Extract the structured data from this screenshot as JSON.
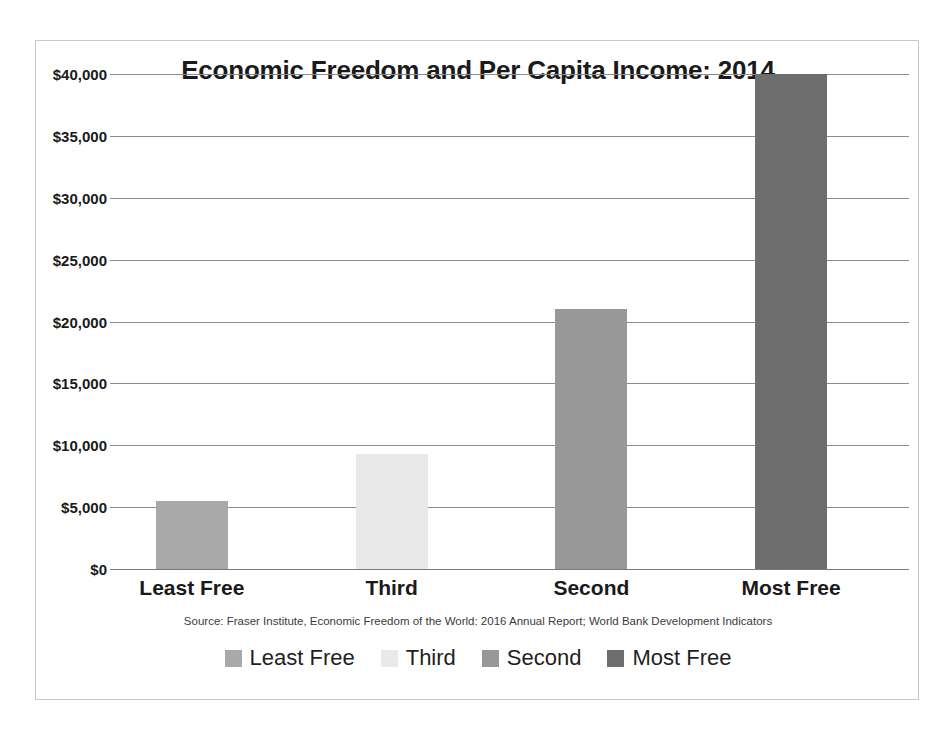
{
  "chart_data": {
    "type": "bar",
    "title": "Economic Freedom and Per Capita Income: 2014",
    "categories": [
      "Least Free",
      "Third",
      "Second",
      "Most Free"
    ],
    "values": [
      5500,
      9300,
      21000,
      40000
    ],
    "colors": [
      "#a9a9a9",
      "#e9e9e9",
      "#989898",
      "#6e6e6e"
    ],
    "xlabel": "",
    "ylabel": "",
    "ylim": [
      0,
      40000
    ],
    "ytick_values": [
      0,
      5000,
      10000,
      15000,
      20000,
      25000,
      30000,
      35000,
      40000
    ],
    "ytick_labels": [
      "$0",
      "$5,000",
      "$10,000",
      "$15,000",
      "$20,000",
      "$25,000",
      "$30,000",
      "$35,000",
      "$40,000"
    ],
    "grid": true,
    "legend_position": "bottom",
    "legend": [
      {
        "label": "Least Free",
        "color": "#a9a9a9"
      },
      {
        "label": "Third",
        "color": "#e9e9e9"
      },
      {
        "label": "Second",
        "color": "#989898"
      },
      {
        "label": "Most Free",
        "color": "#6e6e6e"
      }
    ],
    "source_note": "Source: Fraser Institute, Economic Freedom of the World: 2016 Annual Report; World Bank Development Indicators"
  }
}
